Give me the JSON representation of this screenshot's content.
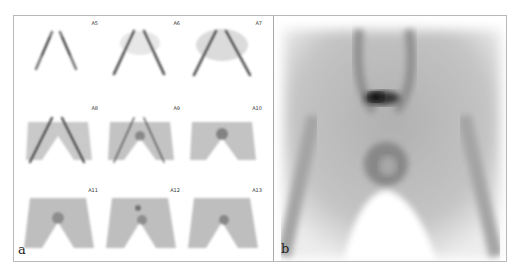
{
  "figure": {
    "panel_a": {
      "letter": "a",
      "frames": [
        {
          "label": "A5",
          "stage": 1
        },
        {
          "label": "A6",
          "stage": 2
        },
        {
          "label": "A7",
          "stage": 3
        },
        {
          "label": "A8",
          "stage": 4
        },
        {
          "label": "A9",
          "stage": 5
        },
        {
          "label": "A10",
          "stage": 6
        },
        {
          "label": "A11",
          "stage": 7
        },
        {
          "label": "A12",
          "stage": 8
        },
        {
          "label": "A13",
          "stage": 9
        }
      ]
    },
    "panel_b": {
      "letter": "b"
    },
    "colors": {
      "border": "#b8b8b8",
      "ink_dark": "#1a1a1a",
      "ink_mid": "#7a7a7a",
      "background": "#ffffff"
    }
  }
}
